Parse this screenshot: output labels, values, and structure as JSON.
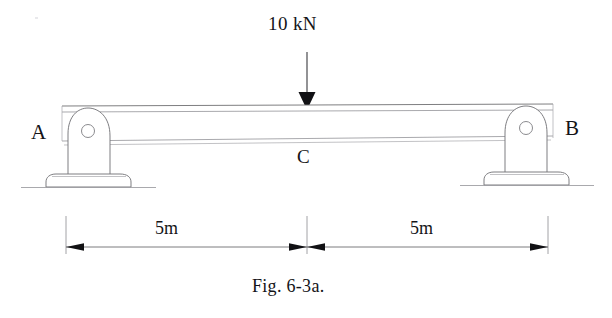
{
  "figure": {
    "caption": "Fig. 6-3a.",
    "type": "engineering-diagram"
  },
  "labels": {
    "load": "10 kN",
    "support_left": "A",
    "support_right": "B",
    "midspan": "C"
  },
  "dimensions": {
    "left_span": "5m",
    "right_span": "5m"
  },
  "colors": {
    "ink": "#141417",
    "line": "#76767a",
    "faint_line": "#a8a8ac",
    "arrow_fill": "#111114",
    "paper": "#ffffff"
  },
  "geometry": {
    "beam_left_x": 62,
    "beam_right_x": 553,
    "beam_top_y": 105,
    "beam_bottom_y": 143,
    "load_x": 307,
    "dimension_y": 247
  }
}
